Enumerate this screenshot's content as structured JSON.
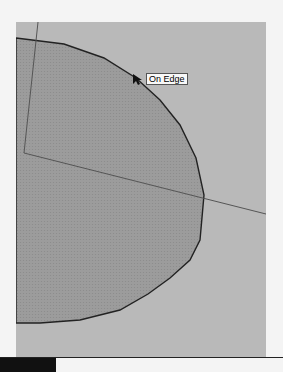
{
  "viewport": {
    "background": "#b9b9b9",
    "face_fill": "#9a9a9a",
    "edge_color": "#222222",
    "axis_color": "#555555"
  },
  "tooltip": {
    "label": "On Edge"
  },
  "cursor": {
    "icon": "arrow-pointer-icon"
  },
  "statusbar": {
    "text": ""
  }
}
